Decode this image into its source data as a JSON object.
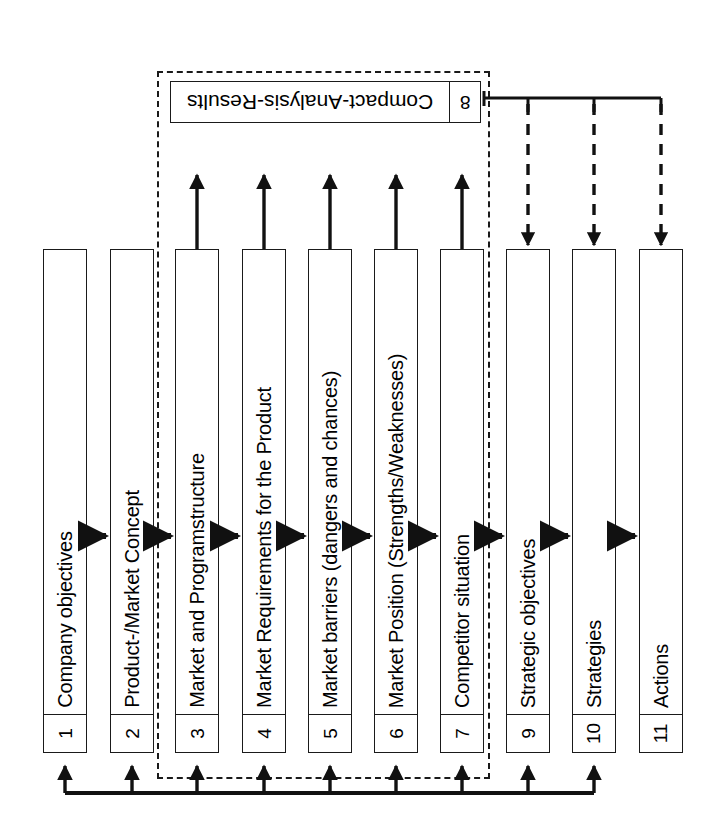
{
  "diagram": {
    "orientation": "rotated-90",
    "colors": {
      "stroke": "#1a1a1a",
      "fill": "#ffffff",
      "text": "#000000"
    },
    "boxes": [
      {
        "number": "1",
        "label": "Company objectives"
      },
      {
        "number": "2",
        "label": "Product-/Market Concept"
      },
      {
        "number": "3",
        "label": "Market and Programstructure"
      },
      {
        "number": "4",
        "label": "Market Requirements for the Product"
      },
      {
        "number": "5",
        "label": "Market barriers (dangers and chances)"
      },
      {
        "number": "6",
        "label": "Market Position (Strengths/Weaknesses)"
      },
      {
        "number": "7",
        "label": "Competitor situation"
      },
      {
        "number": "9",
        "label": "Strategic objectives"
      },
      {
        "number": "10",
        "label": "Strategies"
      },
      {
        "number": "11",
        "label": "Actions"
      }
    ],
    "result_box": {
      "number": "8",
      "label": "Compact-Analysis-Results"
    },
    "groups": {
      "analysis_group_members": [
        "3",
        "4",
        "5",
        "6",
        "7",
        "8"
      ]
    },
    "flow": {
      "sequence_arrows": [
        "1->2",
        "2->3",
        "3->4",
        "4->5",
        "5->6",
        "6->7",
        "7->9",
        "9->10",
        "10->11"
      ],
      "input_arrows_to_result": [
        "3->8",
        "4->8",
        "5->8",
        "6->8",
        "7->8"
      ],
      "result_distribution_arrows": [
        "8->9",
        "8->10",
        "8->11"
      ],
      "feedback_targets": [
        "1",
        "2",
        "3",
        "4",
        "5",
        "6",
        "7",
        "9",
        "10"
      ]
    }
  }
}
